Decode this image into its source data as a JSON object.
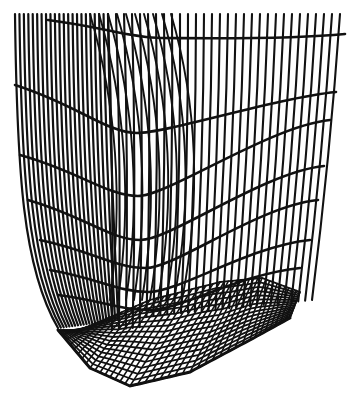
{
  "figure": {
    "type": "wireframe-surface",
    "colors": {
      "background": "#ffffff",
      "line": "#111111"
    },
    "canvas": {
      "width": 356,
      "height": 396
    },
    "left_wall": {
      "line_count": 22,
      "top_y": 14,
      "top_x_start": 15,
      "top_x_end": 108,
      "bottom_x_start": 58,
      "bottom_x_end": 118,
      "bottom_y": 328
    },
    "right_wall": {
      "line_count": 30,
      "top_y": 14,
      "top_x_start": 108,
      "top_x_end": 340,
      "bottom_x_start": 100,
      "bottom_x_end": 300,
      "bottom_y": 320
    },
    "cross_curves": [
      {
        "y_left": 20,
        "y_mid": 38,
        "y_right": 34,
        "x_start": 48,
        "x_end": 345
      },
      {
        "y_left": 85,
        "y_mid": 133,
        "y_right": 92,
        "x_start": 15,
        "x_end": 336
      },
      {
        "y_left": 155,
        "y_mid": 196,
        "y_right": 120,
        "x_start": 20,
        "x_end": 330
      },
      {
        "y_left": 200,
        "y_mid": 240,
        "y_right": 166,
        "x_start": 28,
        "x_end": 324
      },
      {
        "y_left": 240,
        "y_mid": 268,
        "y_right": 200,
        "x_start": 40,
        "x_end": 318
      },
      {
        "y_left": 270,
        "y_mid": 292,
        "y_right": 240,
        "x_start": 50,
        "x_end": 310
      },
      {
        "y_left": 295,
        "y_mid": 310,
        "y_right": 268,
        "x_start": 58,
        "x_end": 300
      }
    ],
    "floor_mesh": {
      "rows": 16,
      "cols": 40,
      "back_edge": [
        [
          80,
          330
        ],
        [
          150,
          300
        ],
        [
          220,
          282
        ],
        [
          262,
          278
        ],
        [
          300,
          292
        ]
      ],
      "front_edge": [
        [
          58,
          330
        ],
        [
          90,
          368
        ],
        [
          130,
          386
        ],
        [
          190,
          372
        ],
        [
          250,
          340
        ],
        [
          290,
          318
        ]
      ]
    }
  }
}
